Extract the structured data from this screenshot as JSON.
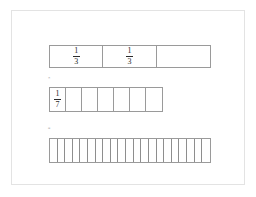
{
  "page": {
    "background_color": "#ffffff",
    "sheet_border_color": "#e3e3e3",
    "line_color": "#9a9a9a",
    "text_color": "#2b2b2b"
  },
  "diagram": {
    "type": "fraction-bar-model",
    "bars": [
      {
        "name": "bar-thirds",
        "denominator": 3,
        "cell_count": 3,
        "labels": [
          "1/3",
          "1/3",
          ""
        ],
        "numerators": [
          "1",
          "1",
          ""
        ],
        "denominators": [
          "3",
          "3",
          ""
        ]
      },
      {
        "name": "bar-sevenths",
        "denominator": 7,
        "cell_count": 7,
        "labels": [
          "1/7",
          "",
          "",
          "",
          "",
          "",
          ""
        ],
        "numerators": [
          "1",
          "",
          "",
          "",
          "",
          "",
          ""
        ],
        "denominators": [
          "7",
          "",
          "",
          "",
          "",
          "",
          ""
        ]
      },
      {
        "name": "bar-twentyoneths",
        "denominator": 21,
        "cell_count": 21,
        "labels": [
          "",
          "",
          "",
          "",
          "",
          "",
          "",
          "",
          "",
          "",
          "",
          "",
          "",
          "",
          "",
          "",
          "",
          "",
          "",
          "",
          ""
        ],
        "numerators": [
          "",
          "",
          "",
          "",
          "",
          "",
          "",
          "",
          "",
          "",
          "",
          "",
          "",
          "",
          "",
          "",
          "",
          "",
          "",
          "",
          ""
        ],
        "denominators": [
          "",
          "",
          "",
          "",
          "",
          "",
          "",
          "",
          "",
          "",
          "",
          "",
          "",
          "",
          "",
          "",
          "",
          "",
          "",
          "",
          ""
        ]
      }
    ],
    "operators": [
      {
        "name": "multiply",
        "symbol": "×"
      },
      {
        "name": "equals",
        "symbol": "="
      }
    ]
  }
}
